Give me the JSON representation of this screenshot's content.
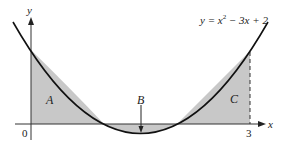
{
  "figure": {
    "equation": "y = x² − 3x + 2",
    "equation_parts": {
      "lhs": "y = x",
      "exp": "2",
      "rhs": " − 3x + 2"
    },
    "axis_labels": {
      "x": "x",
      "y": "y"
    },
    "tick_labels": {
      "origin": "0",
      "x3": "3"
    },
    "region_labels": {
      "a": "A",
      "b": "B",
      "c": "C"
    },
    "colors": {
      "shade": "#c8c8c8",
      "curve": "#111111",
      "axis": "#333333"
    }
  }
}
